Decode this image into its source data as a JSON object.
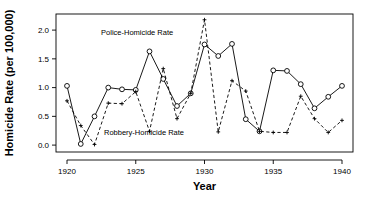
{
  "chart_data": {
    "type": "line",
    "title": "",
    "xlabel": "Year",
    "ylabel": "Homicide Rate (per 100,000)",
    "xlim": [
      1919.2,
      1940.8
    ],
    "ylim": [
      -0.12,
      2.28
    ],
    "xticks": [
      1920,
      1925,
      1930,
      1935,
      1940
    ],
    "xticklabels": [
      "1920",
      "1925",
      "1930",
      "1935",
      "1940"
    ],
    "yticks": [
      0.0,
      0.5,
      1.0,
      1.5,
      2.0
    ],
    "yticklabels": [
      "0.0",
      "0.5",
      "1.0",
      "1.5",
      "2.0"
    ],
    "grid": false,
    "legend_position": "inline-annotations",
    "x": [
      1920,
      1921,
      1922,
      1923,
      1924,
      1925,
      1926,
      1927,
      1928,
      1929,
      1930,
      1931,
      1932,
      1933,
      1934,
      1935,
      1936,
      1937,
      1938,
      1939,
      1940
    ],
    "series": [
      {
        "name": "Police-Homicide Rate",
        "linestyle": "solid",
        "marker": "open-circle",
        "color": "#000000",
        "annotation_x": 1925.1,
        "annotation_y": 1.91,
        "values": [
          1.03,
          0.02,
          0.5,
          1.0,
          0.97,
          0.96,
          1.63,
          1.15,
          0.68,
          0.9,
          1.75,
          1.55,
          1.76,
          0.45,
          0.24,
          1.3,
          1.29,
          1.06,
          0.64,
          0.84,
          1.03
        ]
      },
      {
        "name": "Robbery-Homicide Rate",
        "linestyle": "dashed",
        "marker": "small-cross",
        "color": "#000000",
        "annotation_x": 1925.6,
        "annotation_y": 0.17,
        "values": [
          0.77,
          0.34,
          0.01,
          0.73,
          0.72,
          0.93,
          0.24,
          1.33,
          0.46,
          0.9,
          2.18,
          0.23,
          1.12,
          0.94,
          0.24,
          0.22,
          0.22,
          0.85,
          0.46,
          0.22,
          0.43
        ]
      }
    ]
  }
}
